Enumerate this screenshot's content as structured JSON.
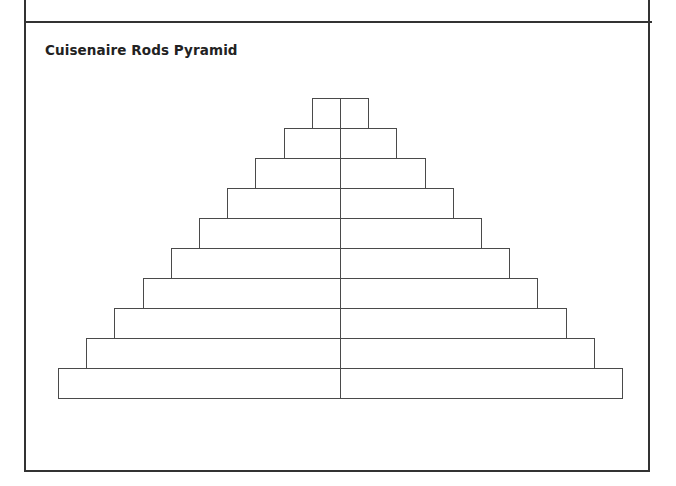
{
  "worksheet": {
    "title": "Cuisenaire Rods Pyramid",
    "line_color": "#4a4a4a",
    "border_color": "#333333"
  },
  "pyramid": {
    "rows": 10,
    "center_x": 340,
    "top_y": 98,
    "row_height": 30,
    "half_width_step": 28.2,
    "split": "each row divided into two equal halves at the center line"
  }
}
